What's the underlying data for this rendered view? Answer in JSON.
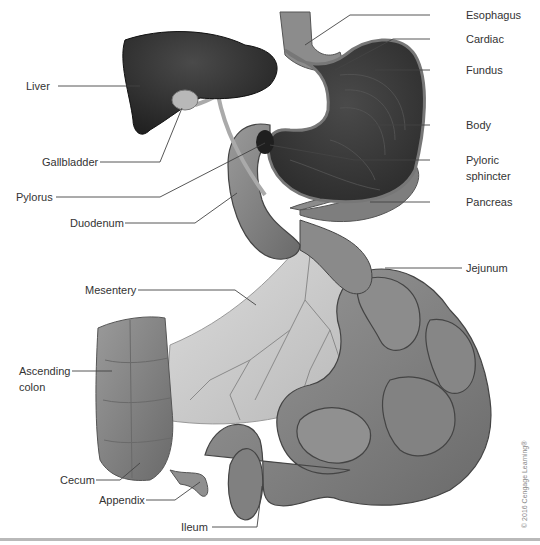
{
  "figure": {
    "type": "anatomical-illustration",
    "copyright": "© 2016 Cengage Learning®",
    "colors": {
      "background": "#ffffff",
      "label_text": "#333333",
      "leader_line": "#444444",
      "liver": "#2a2a2a",
      "stomach_interior": "#3a3a3a",
      "stomach_wall": "#8a8a8a",
      "intestine": "#7d7d7d",
      "mesentery": "#c8c8c8",
      "bottom_rule": "#b9b9b9"
    }
  },
  "labels": {
    "left": [
      {
        "id": "liver",
        "text": "Liver"
      },
      {
        "id": "gallbladder",
        "text": "Gallbladder"
      },
      {
        "id": "pylorus",
        "text": "Pylorus"
      },
      {
        "id": "duodenum",
        "text": "Duodenum"
      },
      {
        "id": "mesentery",
        "text": "Mesentery"
      },
      {
        "id": "ascending_colon_1",
        "text": "Ascending"
      },
      {
        "id": "ascending_colon_2",
        "text": "colon"
      },
      {
        "id": "cecum",
        "text": "Cecum"
      },
      {
        "id": "appendix",
        "text": "Appendix"
      },
      {
        "id": "ileum",
        "text": "Ileum"
      }
    ],
    "right": [
      {
        "id": "esophagus",
        "text": "Esophagus"
      },
      {
        "id": "cardiac",
        "text": "Cardiac"
      },
      {
        "id": "fundus",
        "text": "Fundus"
      },
      {
        "id": "body",
        "text": "Body"
      },
      {
        "id": "pyloric_sphincter_1",
        "text": "Pyloric"
      },
      {
        "id": "pyloric_sphincter_2",
        "text": "sphincter"
      },
      {
        "id": "pancreas",
        "text": "Pancreas"
      },
      {
        "id": "jejunum",
        "text": "Jejunum"
      }
    ]
  }
}
